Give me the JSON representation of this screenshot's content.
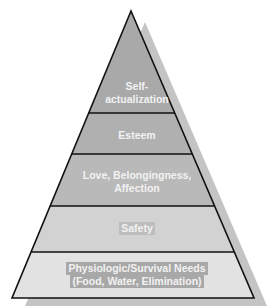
{
  "diagram": {
    "type": "pyramid",
    "levels": [
      {
        "id": "self-actualization",
        "lines": [
          "Self-",
          "actualization"
        ],
        "fill": "#a9a9a9",
        "label_bg": null
      },
      {
        "id": "esteem",
        "lines": [
          "Esteem"
        ],
        "fill": "#b0b0b0",
        "label_bg": null
      },
      {
        "id": "love",
        "lines": [
          "Love, Belongingness,",
          "Affection"
        ],
        "fill": "#b9b9b9",
        "label_bg": null
      },
      {
        "id": "safety",
        "lines": [
          "Safety"
        ],
        "fill": "#d2d2d2",
        "label_bg": "#bdbdbd"
      },
      {
        "id": "physiologic",
        "lines": [
          "Physiologic/Survival Needs",
          "(Food, Water, Elimination)"
        ],
        "fill": "#e2e2e2",
        "label_bg": "#a8a8a8"
      }
    ],
    "colors": {
      "outline": "#111111",
      "shadow": "#c4c4c4",
      "text": "#f2f2f2"
    }
  }
}
